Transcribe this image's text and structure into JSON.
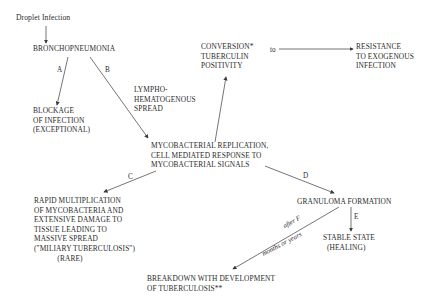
{
  "diagram": {
    "nodes": {
      "droplet": "Droplet Infection",
      "broncho": "BRONCHOPNEUMONIA",
      "blockage": "BLOCKAGE\nOF INFECTION\n(EXCEPTIONAL)",
      "lympho": "LYMPHO-\nHEMATOGENOUS\nSPREAD",
      "conversion": "CONVERSION*\nTUBERCULIN\nPOSITIVITY",
      "resistance": "RESISTANCE\nTO EXOGENOUS\nINFECTION",
      "replication": "MYCOBACTERIAL REPLICATION,\nCELL MEDIATED RESPONSE TO\nMYCOBACTERIAL SIGNALS",
      "rapid": "RAPID MULTIPLICATION\nOF MYCOBACTERIA AND\nEXTENSIVE DAMAGE TO\nTISSUE LEADING TO\nMASSIVE SPREAD\n(\"MILIARY TUBERCULOSIS\")\n            (RARE)",
      "granuloma": "GRANULOMA FORMATION",
      "stable": "STABLE STATE\n  (HEALING)",
      "breakdown": "BREAKDOWN WITH DEVELOPMENT\nOF TUBERCULOSIS**"
    },
    "edge_labels": {
      "a": "A",
      "b": "B",
      "c": "C",
      "d": "D",
      "e": "E",
      "to": "to",
      "after_f": "after F",
      "months": "months or years"
    },
    "colors": {
      "line": "#3a3a3a",
      "text": "#2a2a2a",
      "background": "#ffffff"
    }
  }
}
